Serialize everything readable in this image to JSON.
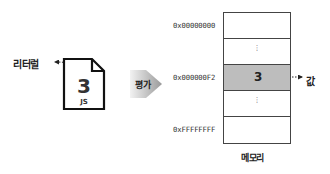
{
  "literal": {
    "label": "리터럴",
    "file_value": "3",
    "file_extension": "JS"
  },
  "evaluation": {
    "label": "평가"
  },
  "memory": {
    "title": "메모리",
    "addresses": [
      {
        "label": "0x00000000",
        "row": 0
      },
      {
        "label": "0x000000F2",
        "row": 2
      },
      {
        "label": "0xFFFFFFFF",
        "row": 4
      }
    ],
    "cells": [
      {
        "content": "",
        "type": "empty"
      },
      {
        "content": "⋮",
        "type": "ellipsis"
      },
      {
        "content": "3",
        "type": "value",
        "highlighted": true
      },
      {
        "content": "⋮",
        "type": "ellipsis"
      },
      {
        "content": "",
        "type": "empty"
      }
    ],
    "highlight_color": "#bdbdbd"
  },
  "value_annotation": {
    "label": "값"
  }
}
